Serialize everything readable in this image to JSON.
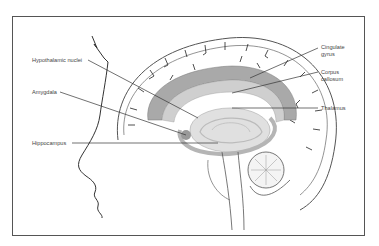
{
  "figure": {
    "labels_left": [
      {
        "id": "hypothalamic-nuclei",
        "text": "Hypothalamic nuclei"
      },
      {
        "id": "amygdala",
        "text": "Amygdala"
      },
      {
        "id": "hippocampus",
        "text": "Hippocampus"
      }
    ],
    "labels_right": [
      {
        "id": "cingulate-gyrus",
        "text": "Cingulate gyrus"
      },
      {
        "id": "corpus-callosum",
        "text": "Corpus callosum"
      },
      {
        "id": "thalamus",
        "text": "Thalamus"
      }
    ],
    "colors": {
      "frame": "#555555",
      "outline": "#333333",
      "limbic_fill": "#a9a9a9",
      "limbic_light": "#cfcfcf",
      "text": "#444444"
    }
  }
}
